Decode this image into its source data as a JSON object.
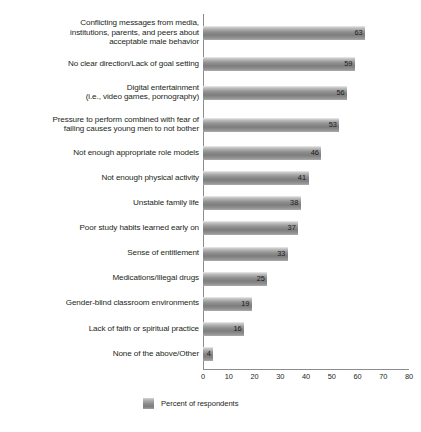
{
  "chart_data": {
    "type": "bar",
    "orientation": "horizontal",
    "title": "",
    "subtitle": "",
    "xlabel": "",
    "ylabel": "",
    "xlim": [
      0,
      80
    ],
    "xticks": [
      0,
      10,
      20,
      30,
      40,
      50,
      60,
      70,
      80
    ],
    "grid": false,
    "legend_position": "bottom",
    "legend": [
      "Percent of respondents"
    ],
    "bar_color": "#8a8a8a",
    "categories": [
      "Conflicting messages from media,\ninstitutions, parents, and peers about\nacceptable male behavior",
      "No clear direction/Lack of goal setting",
      "Digital entertainment\n(i.e., video games, pornography)",
      "Pressure to perform combined with fear of\nfailing causes young men to not bother",
      "Not enough appropriate role models",
      "Not enough physical activity",
      "Unstable family life",
      "Poor study habits learned early on",
      "Sense of entitlement",
      "Medications/Illegal drugs",
      "Gender-blind classroom environments",
      "Lack of faith or spiritual practice",
      "None of the above/Other"
    ],
    "values": [
      63,
      59,
      56,
      53,
      46,
      41,
      38,
      37,
      33,
      25,
      19,
      16,
      4
    ],
    "value_labels": [
      "63",
      "59",
      "56",
      "53",
      "46",
      "41",
      "38",
      "37",
      "33",
      "25",
      "19",
      "16",
      "4"
    ]
  },
  "legend": {
    "series_label": "Percent of respondents",
    "swatch": "bar-swatch"
  },
  "axis": {
    "tick_labels": [
      "0",
      "10",
      "20",
      "30",
      "40",
      "50",
      "60",
      "70",
      "80"
    ]
  }
}
